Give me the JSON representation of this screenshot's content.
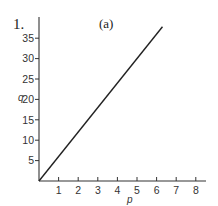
{
  "problem_number": "1.",
  "panel_label": "(a)",
  "chart_data": {
    "type": "line",
    "title": "(a)",
    "xlabel": "p",
    "ylabel": "q",
    "xlim": [
      0,
      8.5
    ],
    "ylim": [
      0,
      39
    ],
    "xticks": [
      1,
      2,
      3,
      4,
      5,
      6,
      7,
      8
    ],
    "yticks": [
      5,
      10,
      15,
      20,
      25,
      30,
      35
    ],
    "grid": false,
    "legend": null,
    "series": [
      {
        "name": "q = 6p",
        "x": [
          0,
          6.3
        ],
        "y": [
          0,
          37.8
        ]
      }
    ]
  }
}
